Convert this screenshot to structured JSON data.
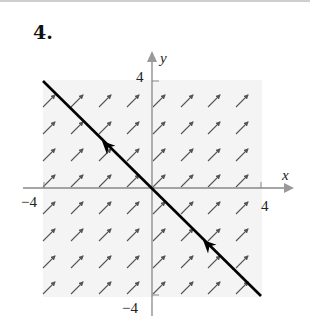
{
  "problem_number": "4.",
  "axes": {
    "x_label": "x",
    "y_label": "y",
    "x_tick_neg": "−4",
    "x_tick_pos": "4",
    "y_tick_pos": "4",
    "y_tick_neg": "−4",
    "xlim": [
      -4,
      4
    ],
    "ylim": [
      -4,
      4
    ]
  },
  "direction_field": {
    "slope": 1,
    "grid_columns_px": [
      49,
      77,
      105,
      133,
      159,
      187,
      214,
      242
    ],
    "grid_rows_px": [
      101,
      128,
      155,
      181,
      208,
      235,
      262,
      288
    ],
    "shading_color": "#f4f4f4",
    "arrow_color": "#555555"
  },
  "solution_curve": {
    "description": "straight line y = -x with arrows pointing toward upper-left",
    "color": "#000000",
    "start_px": [
      43,
      81
    ],
    "end_px": [
      261,
      296
    ],
    "arrowheads_px": [
      [
        102,
        141
      ],
      [
        203,
        240
      ]
    ]
  }
}
